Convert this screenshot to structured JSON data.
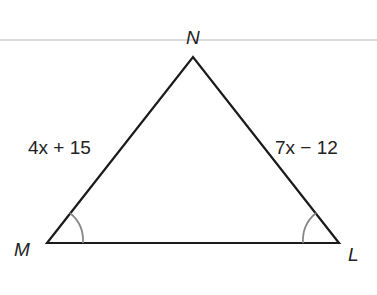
{
  "diagram": {
    "type": "triangle",
    "vertices": [
      {
        "name": "N",
        "x": 193,
        "y": 57,
        "label_x": 186,
        "label_y": 44
      },
      {
        "name": "M",
        "x": 47,
        "y": 243,
        "label_x": 16,
        "label_y": 255
      },
      {
        "name": "L",
        "x": 339,
        "y": 243,
        "label_x": 349,
        "label_y": 261
      }
    ],
    "sides": [
      {
        "from": "M",
        "to": "N",
        "label": "4x + 15"
      },
      {
        "from": "N",
        "to": "L",
        "label": "7x − 12"
      },
      {
        "from": "M",
        "to": "L",
        "label": ""
      }
    ],
    "angle_marks": [
      "M",
      "L"
    ],
    "colors": {
      "stroke": "#1a1a1a",
      "angle_arc": "#888888",
      "rule": "#d8d8d8"
    }
  }
}
